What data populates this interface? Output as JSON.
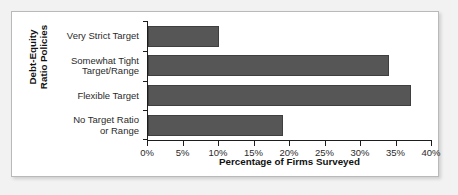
{
  "chart_data": {
    "type": "bar",
    "orientation": "horizontal",
    "title": "",
    "xlabel": "Percentage of Firms Surveyed",
    "ylabel": "Debt-Equity Ratio Policies",
    "ylabel_lines": [
      "Debt-Equity",
      "Ratio Policies"
    ],
    "categories": [
      "Very Strict Target",
      "Somewhat Tight Target/Range",
      "Flexible Target",
      "No Target Ratio or Range"
    ],
    "category_lines": [
      [
        "Very Strict Target"
      ],
      [
        "Somewhat Tight",
        "Target/Range"
      ],
      [
        "Flexible Target"
      ],
      [
        "No Target Ratio",
        "or Range"
      ]
    ],
    "values": [
      10,
      34,
      37,
      19
    ],
    "xlim": [
      0,
      40
    ],
    "xticks": [
      0,
      5,
      10,
      15,
      20,
      25,
      30,
      35,
      40
    ],
    "xtick_labels": [
      "0%",
      "5%",
      "10%",
      "15%",
      "20%",
      "25%",
      "30%",
      "35%",
      "40%"
    ],
    "grid": false,
    "legend": false,
    "bar_color": "#565656",
    "bar_edge_color": "#3f3f3f",
    "axis_color": "#1d1d1d",
    "panel_background": "#ffffff",
    "figure_background": "#f2f2f2"
  }
}
